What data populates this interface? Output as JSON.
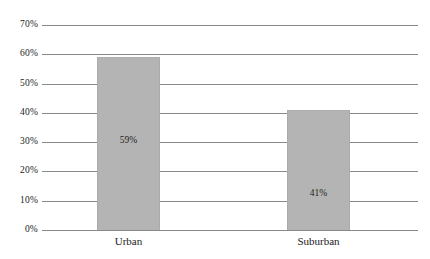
{
  "chart_data": {
    "type": "bar",
    "title": "",
    "subtitle": "",
    "xlabel": "",
    "ylabel": "",
    "categories": [
      "Urban",
      "Suburban"
    ],
    "values": [
      59,
      41
    ],
    "value_labels": [
      "59%",
      "41%"
    ],
    "ylim": [
      0,
      70
    ],
    "ytick_values": [
      0,
      10,
      20,
      30,
      40,
      50,
      60,
      70
    ],
    "ytick_labels": [
      "0%",
      "10%",
      "20%",
      "30%",
      "40%",
      "50%",
      "60%",
      "70%"
    ],
    "grid": true,
    "legend": null,
    "legend_position": "none",
    "annotations": [],
    "colors": {
      "bar_fill": "#b4b4b4",
      "bar_edge": "#ababab",
      "gridline": "#8a8a8a",
      "text": "#1a1a1a",
      "background": "#ffffff"
    }
  }
}
